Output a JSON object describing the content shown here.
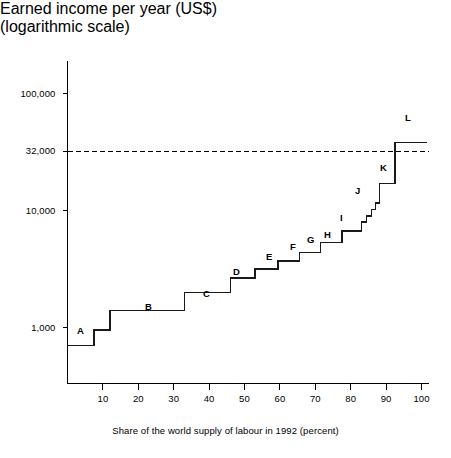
{
  "chart_data": {
    "type": "line",
    "title": "Earned income per year (US$)",
    "subtitle": "(logarithmic scale)",
    "ylabel": "Earned income per year (US$) (logarithmic scale)",
    "xlabel": "Share of the world supply of labour in 1992 (percent)",
    "scale": "logarithmic",
    "grid": false,
    "legend": "none",
    "xlim": [
      0,
      104
    ],
    "ylim": [
      500,
      160000
    ],
    "y_ticks": [
      {
        "value": 100000,
        "label": "100,000"
      },
      {
        "value": 32000,
        "label": "32,000"
      },
      {
        "value": 10000,
        "label": "10,000"
      },
      {
        "value": 1000,
        "label": "1,000"
      }
    ],
    "x_ticks": [
      {
        "value": 10,
        "label": "10"
      },
      {
        "value": 20,
        "label": "20"
      },
      {
        "value": 30,
        "label": "30"
      },
      {
        "value": 40,
        "label": "40"
      },
      {
        "value": 50,
        "label": "50"
      },
      {
        "value": 60,
        "label": "60"
      },
      {
        "value": 70,
        "label": "70"
      },
      {
        "value": 80,
        "label": "80"
      },
      {
        "value": 90,
        "label": "90"
      },
      {
        "value": 100,
        "label": "100"
      }
    ],
    "reference_line": {
      "value": 32000,
      "label": "32,000",
      "style": "dashed"
    },
    "steps": [
      {
        "label": "A",
        "x_start": 0,
        "x_end": 7.5,
        "income": 700
      },
      {
        "label": "",
        "x_start": 7.5,
        "x_end": 12.0,
        "income": 950
      },
      {
        "label": "B",
        "x_start": 12.0,
        "x_end": 33.0,
        "income": 1400
      },
      {
        "label": "C",
        "x_start": 33.0,
        "x_end": 46.0,
        "income": 2000
      },
      {
        "label": "D",
        "x_start": 46.0,
        "x_end": 53.0,
        "income": 2650
      },
      {
        "label": "E",
        "x_start": 53.0,
        "x_end": 59.5,
        "income": 3150
      },
      {
        "label": "F",
        "x_start": 59.5,
        "x_end": 65.5,
        "income": 3700
      },
      {
        "label": "G",
        "x_start": 65.5,
        "x_end": 71.5,
        "income": 4350
      },
      {
        "label": "H",
        "x_start": 71.5,
        "x_end": 77.5,
        "income": 5300
      },
      {
        "label": "I",
        "x_start": 77.5,
        "x_end": 83.0,
        "income": 6700
      },
      {
        "label": "J",
        "x_start": 83.0,
        "x_end": 84.5,
        "income": 8000
      },
      {
        "label": "",
        "x_start": 84.5,
        "x_end": 85.8,
        "income": 9000
      },
      {
        "label": "",
        "x_start": 85.8,
        "x_end": 87.0,
        "income": 10200
      },
      {
        "label": "",
        "x_start": 87.0,
        "x_end": 88.2,
        "income": 11600
      },
      {
        "label": "K",
        "x_start": 88.2,
        "x_end": 92.5,
        "income": 17000
      },
      {
        "label": "L",
        "x_start": 92.5,
        "x_end": 101.5,
        "income": 38000
      }
    ],
    "step_letters": [
      {
        "label": "A",
        "x": 77,
        "y": 325
      },
      {
        "label": "B",
        "x": 145,
        "y": 301
      },
      {
        "label": "C",
        "x": 203,
        "y": 288
      },
      {
        "label": "D",
        "x": 233,
        "y": 266
      },
      {
        "label": "E",
        "x": 266,
        "y": 251
      },
      {
        "label": "F",
        "x": 290,
        "y": 241
      },
      {
        "label": "G",
        "x": 307,
        "y": 234
      },
      {
        "label": "H",
        "x": 324,
        "y": 229
      },
      {
        "label": "I",
        "x": 340,
        "y": 212
      },
      {
        "label": "J",
        "x": 355,
        "y": 185
      },
      {
        "label": "K",
        "x": 380,
        "y": 162
      },
      {
        "label": "L",
        "x": 405,
        "y": 112
      }
    ],
    "axis_color": "#000000",
    "line_color": "#1a1a1a",
    "reference_line_color": "#000000"
  }
}
